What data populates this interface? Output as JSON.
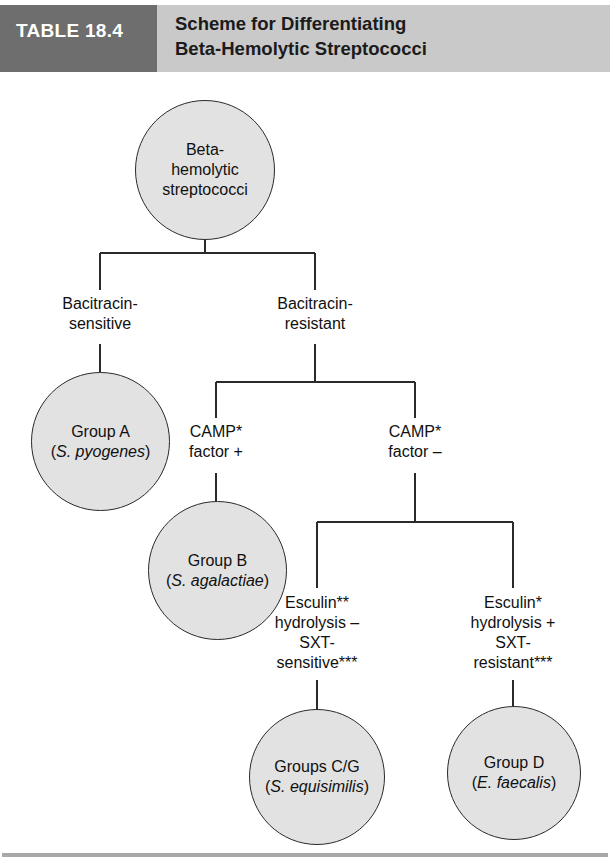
{
  "header": {
    "table_number": "TABLE 18.4",
    "title_lines": [
      "Scheme for Differentiating",
      "Beta-Hemolytic Streptococci"
    ],
    "block_color": "#6e6e6e",
    "band_color": "#c9c9c9"
  },
  "diagram": {
    "node_fill": "#e2e2e2",
    "node_stroke": "#2a2a2a",
    "nodes": {
      "root": {
        "lines": [
          "Beta-",
          "hemolytic",
          "streptococci"
        ]
      },
      "group_a": {
        "line1": "Group A",
        "line2_open": "(",
        "line2_species": "S. pyogenes",
        "line2_close": ")"
      },
      "group_b": {
        "line1": "Group B",
        "line2_open": "(",
        "line2_species": "S. agalactiae",
        "line2_close": ")"
      },
      "groups_cg": {
        "line1": "Groups C/G",
        "line2_open": "(",
        "line2_species": "S. equisimilis",
        "line2_close": ")"
      },
      "group_d": {
        "line1": "Group D",
        "line2_open": "(",
        "line2_species": "E. faecalis",
        "line2_close": ")"
      }
    },
    "branch_labels": {
      "bacitracin_sensitive": [
        "Bacitracin-",
        "sensitive"
      ],
      "bacitracin_resistant": [
        "Bacitracin-",
        "resistant"
      ],
      "camp_positive": [
        "CAMP*",
        "factor +"
      ],
      "camp_negative": [
        "CAMP*",
        "factor –"
      ],
      "esculin_negative": [
        "Esculin**",
        "hydrolysis –",
        "SXT-",
        "sensitive***"
      ],
      "esculin_positive": [
        "Esculin*",
        "hydrolysis +",
        "SXT-",
        "resistant***"
      ]
    }
  }
}
